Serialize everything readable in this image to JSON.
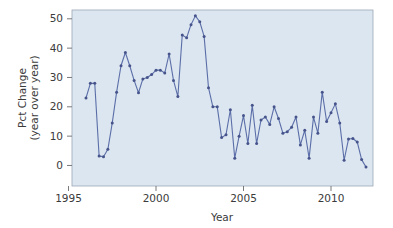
{
  "chart_data": {
    "type": "line",
    "title": "",
    "xlabel": "Year",
    "ylabel": "Pct Change\n(year over year)",
    "ylabel_line1": "Pct Change",
    "ylabel_line2": "(year over year)",
    "xlim": [
      1995.2,
      2012.4
    ],
    "ylim": [
      -7,
      53
    ],
    "xticks": [
      1995,
      2000,
      2005,
      2010
    ],
    "xtick_labels": [
      "1995",
      "2000",
      "2005",
      "2010"
    ],
    "yticks": [
      0,
      10,
      20,
      30,
      40,
      50
    ],
    "ytick_labels": [
      "0",
      "10",
      "20",
      "30",
      "40",
      "50"
    ],
    "grid": false,
    "legend": "none",
    "marker": "circle",
    "line_color": "#5b6ea8",
    "marker_color": "#47548c",
    "plot_background": "#dce6f0",
    "series": [
      {
        "name": "Pct Change (year over year)",
        "x": [
          1996.0,
          1996.25,
          1996.5,
          1996.75,
          1997.0,
          1997.25,
          1997.5,
          1997.75,
          1998.0,
          1998.25,
          1998.5,
          1998.75,
          1999.0,
          1999.25,
          1999.5,
          1999.75,
          2000.0,
          2000.25,
          2000.5,
          2000.75,
          2001.0,
          2001.25,
          2001.5,
          2001.75,
          2002.0,
          2002.25,
          2002.5,
          2002.75,
          2003.0,
          2003.25,
          2003.5,
          2003.75,
          2004.0,
          2004.25,
          2004.5,
          2004.75,
          2005.0,
          2005.25,
          2005.5,
          2005.75,
          2006.0,
          2006.25,
          2006.5,
          2006.75,
          2007.0,
          2007.25,
          2007.5,
          2007.75,
          2008.0,
          2008.25,
          2008.5,
          2008.75,
          2009.0,
          2009.25,
          2009.5,
          2009.75,
          2010.0,
          2010.25,
          2010.5,
          2010.75,
          2011.0,
          2011.25,
          2011.5,
          2011.75,
          2012.0
        ],
        "y": [
          23.0,
          28.0,
          28.0,
          3.2,
          3.0,
          5.5,
          14.5,
          25.0,
          34.0,
          38.5,
          34.0,
          29.0,
          24.8,
          29.5,
          30.0,
          31.0,
          32.5,
          32.5,
          31.5,
          38.0,
          29.0,
          23.5,
          44.5,
          43.5,
          48.0,
          51.0,
          49.0,
          44.0,
          26.5,
          20.0,
          20.0,
          9.5,
          10.5,
          19.0,
          2.5,
          10.0,
          17.0,
          7.5,
          20.5,
          7.5,
          15.5,
          16.5,
          14.0,
          20.0,
          16.0,
          11.0,
          11.5,
          13.0,
          16.5,
          7.0,
          12.0,
          2.5,
          16.5,
          11.0,
          25.0,
          15.0,
          18.0,
          21.0,
          14.5,
          1.8,
          9.0,
          9.2,
          8.0,
          2.0,
          -0.5
        ]
      }
    ],
    "data_points_count": 65,
    "units": "percent"
  },
  "axes": {
    "x_axis_label": "Year",
    "y_axis_label_line1": "Pct Change",
    "y_axis_label_line2": "(year over year)"
  }
}
